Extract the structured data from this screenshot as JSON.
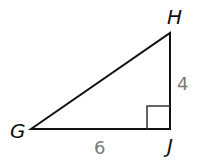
{
  "diagram": {
    "type": "right-triangle",
    "vertices": {
      "G": {
        "label": "G",
        "x": 31,
        "y": 129
      },
      "H": {
        "label": "H",
        "x": 170,
        "y": 33
      },
      "J": {
        "label": "J",
        "x": 170,
        "y": 129
      }
    },
    "sides": {
      "HJ": {
        "label": "4"
      },
      "GJ": {
        "label": "6"
      },
      "GH": {
        "label": ""
      }
    },
    "right_angle_at": "J",
    "colors": {
      "stroke": "#111111",
      "side_label": "#7a7a7a",
      "background": "#ffffff"
    }
  }
}
